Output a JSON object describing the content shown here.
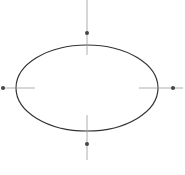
{
  "diagram": {
    "type": "ellipse-with-handles",
    "canvas": {
      "width": 185,
      "height": 175,
      "background": "#ffffff"
    },
    "ellipse": {
      "cx": 87,
      "cy": 88,
      "rx": 71,
      "ry": 43,
      "stroke": "#333333",
      "stroke_width": 1.2
    },
    "handle_line_color": "#9a9a9a",
    "handle_dot_color": "#444444",
    "handles": [
      {
        "name": "top",
        "x1": 87,
        "y1": 0,
        "x2": 87,
        "y2": 55,
        "dot": {
          "cx": 87,
          "cy": 33,
          "r": 2
        }
      },
      {
        "name": "bottom",
        "x1": 87,
        "y1": 115,
        "x2": 87,
        "y2": 160,
        "dot": {
          "cx": 87,
          "cy": 144,
          "r": 2
        }
      },
      {
        "name": "left",
        "x1": 2,
        "y1": 88,
        "x2": 35,
        "y2": 88,
        "dot": {
          "cx": 3,
          "cy": 88,
          "r": 2
        }
      },
      {
        "name": "right",
        "x1": 139,
        "y1": 88,
        "x2": 183,
        "y2": 88,
        "dot": {
          "cx": 173,
          "cy": 88,
          "r": 2
        }
      }
    ]
  }
}
